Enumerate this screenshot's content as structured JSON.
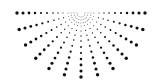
{
  "graphic": {
    "title": "Radial halftone dot burst",
    "background": "#ffffff",
    "dot_color": "#111111",
    "center": {
      "x": 81,
      "y": 13
    },
    "ray_angles_deg": [
      0,
      15,
      30,
      45,
      60,
      75,
      90,
      105,
      120,
      135,
      150,
      165,
      180
    ],
    "ray_dots": [
      {
        "d": 13,
        "r": 0.45
      },
      {
        "d": 18,
        "r": 0.55
      },
      {
        "d": 23,
        "r": 0.65
      },
      {
        "d": 28,
        "r": 0.8
      },
      {
        "d": 34,
        "r": 0.95
      },
      {
        "d": 40,
        "r": 1.1
      },
      {
        "d": 46,
        "r": 1.25
      },
      {
        "d": 52,
        "r": 1.4
      },
      {
        "d": 58,
        "r": 1.55
      },
      {
        "d": 64,
        "r": 1.7
      }
    ],
    "inner_arcs": [
      {
        "radius": 4,
        "count": 7,
        "r": 0.4
      },
      {
        "radius": 7,
        "count": 11,
        "r": 0.45
      },
      {
        "radius": 10,
        "count": 15,
        "r": 0.45
      }
    ]
  }
}
